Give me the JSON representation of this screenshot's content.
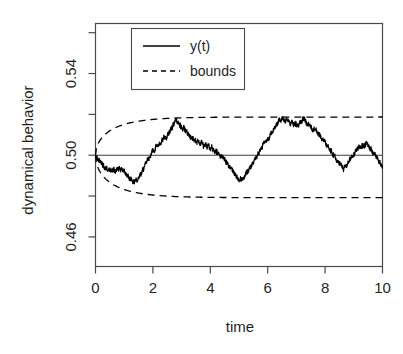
{
  "chart_data": {
    "type": "line",
    "title": "",
    "xlabel": "time",
    "ylabel": "dynamical behavior",
    "xlim": [
      0,
      10
    ],
    "ylim": [
      0.4455,
      0.5645
    ],
    "grid": false,
    "legend_position": "top-left",
    "x_ticks_major": [
      0,
      2,
      4,
      6,
      8,
      10
    ],
    "x_tick_labels": [
      "0",
      "2",
      "4",
      "6",
      "8",
      "10"
    ],
    "y_ticks_major": [
      0.46,
      0.5,
      0.54
    ],
    "y_tick_labels": [
      "0.46",
      "0.50",
      "0.54"
    ],
    "y_ticks_minor": [
      0.48,
      0.52,
      0.56
    ],
    "legend": [
      {
        "label": "y(t)",
        "style": "solid"
      },
      {
        "label": "bounds",
        "style": "dashed"
      }
    ],
    "series": [
      {
        "name": "y(t)",
        "style": "solid",
        "color": "#000000",
        "x": [
          0.0,
          0.04,
          0.08,
          0.12,
          0.16,
          0.2,
          0.24,
          0.28,
          0.32,
          0.36,
          0.4,
          0.44,
          0.48,
          0.52,
          0.56,
          0.6,
          0.64,
          0.68,
          0.72,
          0.76,
          0.8,
          0.84,
          0.88,
          0.92,
          0.96,
          1.0,
          1.04,
          1.08,
          1.12,
          1.16,
          1.2,
          1.24,
          1.28,
          1.32,
          1.36,
          1.4,
          1.44,
          1.48,
          1.52,
          1.56,
          1.6,
          1.64,
          1.68,
          1.72,
          1.76,
          1.8,
          1.84,
          1.88,
          1.92,
          1.96,
          2.0,
          2.04,
          2.08,
          2.12,
          2.16,
          2.2,
          2.24,
          2.28,
          2.32,
          2.36,
          2.4,
          2.44,
          2.48,
          2.52,
          2.56,
          2.6,
          2.64,
          2.68,
          2.72,
          2.76,
          2.8,
          2.84,
          2.88,
          2.92,
          2.96,
          3.0,
          3.04,
          3.08,
          3.12,
          3.16,
          3.2,
          3.24,
          3.28,
          3.32,
          3.36,
          3.4,
          3.44,
          3.48,
          3.52,
          3.56,
          3.6,
          3.64,
          3.68,
          3.72,
          3.76,
          3.8,
          3.84,
          3.88,
          3.92,
          3.96,
          4.0,
          4.04,
          4.08,
          4.12,
          4.16,
          4.2,
          4.24,
          4.28,
          4.32,
          4.36,
          4.4,
          4.44,
          4.48,
          4.52,
          4.56,
          4.6,
          4.64,
          4.68,
          4.72,
          4.76,
          4.8,
          4.84,
          4.88,
          4.92,
          4.96,
          5.0,
          5.04,
          5.08,
          5.12,
          5.16,
          5.2,
          5.24,
          5.28,
          5.32,
          5.36,
          5.4,
          5.44,
          5.48,
          5.52,
          5.56,
          5.6,
          5.64,
          5.68,
          5.72,
          5.76,
          5.8,
          5.84,
          5.88,
          5.92,
          5.96,
          6.0,
          6.04,
          6.08,
          6.12,
          6.16,
          6.2,
          6.24,
          6.28,
          6.32,
          6.36,
          6.4,
          6.44,
          6.48,
          6.52,
          6.56,
          6.6,
          6.64,
          6.68,
          6.72,
          6.76,
          6.8,
          6.84,
          6.88,
          6.92,
          6.96,
          7.0,
          7.04,
          7.08,
          7.12,
          7.16,
          7.2,
          7.24,
          7.28,
          7.32,
          7.36,
          7.4,
          7.44,
          7.48,
          7.52,
          7.56,
          7.6,
          7.64,
          7.68,
          7.72,
          7.76,
          7.8,
          7.84,
          7.88,
          7.92,
          7.96,
          8.0,
          8.04,
          8.08,
          8.12,
          8.16,
          8.2,
          8.24,
          8.28,
          8.32,
          8.36,
          8.4,
          8.44,
          8.48,
          8.52,
          8.56,
          8.6,
          8.64,
          8.68,
          8.72,
          8.76,
          8.8,
          8.84,
          8.88,
          8.92,
          8.96,
          9.0,
          9.04,
          9.08,
          9.12,
          9.16,
          9.2,
          9.24,
          9.28,
          9.32,
          9.36,
          9.4,
          9.44,
          9.48,
          9.52,
          9.56,
          9.6,
          9.64,
          9.68,
          9.72,
          9.76,
          9.8,
          9.84,
          9.88,
          9.92,
          9.96,
          10.0
        ],
        "y": [
          0.5,
          0.4993,
          0.4984,
          0.4979,
          0.4971,
          0.4965,
          0.4957,
          0.4949,
          0.4944,
          0.4936,
          0.4931,
          0.4938,
          0.4932,
          0.4925,
          0.4931,
          0.4922,
          0.4928,
          0.492,
          0.4926,
          0.4934,
          0.4928,
          0.4936,
          0.493,
          0.4922,
          0.4928,
          0.492,
          0.4913,
          0.4906,
          0.4899,
          0.4892,
          0.4885,
          0.4879,
          0.4872,
          0.4866,
          0.4873,
          0.4881,
          0.4874,
          0.4882,
          0.4891,
          0.4902,
          0.4913,
          0.4924,
          0.4936,
          0.4948,
          0.4959,
          0.4971,
          0.4982,
          0.4992,
          0.5004,
          0.5016,
          0.5027,
          0.5021,
          0.5031,
          0.5043,
          0.5053,
          0.5046,
          0.5056,
          0.5066,
          0.5075,
          0.5084,
          0.5092,
          0.5084,
          0.5093,
          0.5102,
          0.5112,
          0.5122,
          0.5132,
          0.5142,
          0.5152,
          0.5163,
          0.5174,
          0.5166,
          0.5158,
          0.515,
          0.5142,
          0.5134,
          0.5126,
          0.5134,
          0.5126,
          0.5118,
          0.511,
          0.5102,
          0.5094,
          0.5086,
          0.5078,
          0.5086,
          0.5078,
          0.507,
          0.5062,
          0.507,
          0.5062,
          0.5054,
          0.5062,
          0.5054,
          0.5046,
          0.5056,
          0.5048,
          0.504,
          0.5048,
          0.504,
          0.5032,
          0.504,
          0.5032,
          0.5022,
          0.5014,
          0.5022,
          0.5014,
          0.5006,
          0.4998,
          0.499,
          0.4998,
          0.499,
          0.4982,
          0.4974,
          0.4966,
          0.4958,
          0.495,
          0.4942,
          0.4934,
          0.4926,
          0.4918,
          0.491,
          0.4902,
          0.4894,
          0.4886,
          0.4878,
          0.4886,
          0.4878,
          0.4886,
          0.4894,
          0.4902,
          0.491,
          0.4918,
          0.4926,
          0.4934,
          0.4942,
          0.4952,
          0.4962,
          0.4972,
          0.4982,
          0.4992,
          0.5002,
          0.5012,
          0.5022,
          0.5032,
          0.5042,
          0.5052,
          0.5062,
          0.5072,
          0.5064,
          0.5074,
          0.5084,
          0.5094,
          0.5104,
          0.5114,
          0.5124,
          0.5134,
          0.5144,
          0.5154,
          0.5164,
          0.5174,
          0.518,
          0.5172,
          0.518,
          0.5172,
          0.5164,
          0.5172,
          0.518,
          0.5172,
          0.5164,
          0.5156,
          0.5164,
          0.5156,
          0.5148,
          0.5156,
          0.5148,
          0.514,
          0.5148,
          0.5156,
          0.5164,
          0.5172,
          0.518,
          0.5172,
          0.5164,
          0.5156,
          0.5148,
          0.5156,
          0.5148,
          0.514,
          0.5132,
          0.5124,
          0.5132,
          0.5124,
          0.5116,
          0.5108,
          0.51,
          0.5092,
          0.5084,
          0.5076,
          0.5068,
          0.506,
          0.5052,
          0.5044,
          0.5036,
          0.5028,
          0.502,
          0.5012,
          0.5004,
          0.4996,
          0.4988,
          0.498,
          0.4972,
          0.4964,
          0.4956,
          0.4948,
          0.494,
          0.4932,
          0.494,
          0.4948,
          0.4956,
          0.4964,
          0.4972,
          0.498,
          0.4988,
          0.4996,
          0.5004,
          0.5012,
          0.502,
          0.5028,
          0.5036,
          0.5044,
          0.5036,
          0.5044,
          0.5052,
          0.5044,
          0.5052,
          0.506,
          0.5052,
          0.5044,
          0.5036,
          0.5028,
          0.502,
          0.5012,
          0.5004,
          0.4996,
          0.4988,
          0.498,
          0.4972,
          0.4964,
          0.4956,
          0.4948
        ]
      },
      {
        "name": "upper bound",
        "style": "dashed",
        "color": "#000000",
        "value_asymptote": 0.5187
      },
      {
        "name": "lower bound",
        "style": "dashed",
        "color": "#000000",
        "value_asymptote": 0.4792
      }
    ],
    "mean_line": {
      "name": "mean",
      "value": 0.5,
      "style": "solid",
      "color": "#3d3d3d"
    },
    "annotations": []
  },
  "axis_titles": {
    "x": "time",
    "y": "dynamical behavior"
  }
}
